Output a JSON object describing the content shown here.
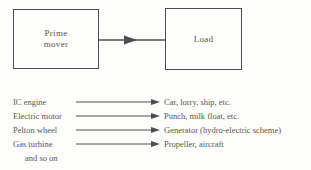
{
  "diagram": {
    "prime_mover": {
      "line1": "Prime",
      "line2": "mover"
    },
    "load": {
      "label": "Load"
    },
    "connector_icon": "arrow-right"
  },
  "mappings": {
    "rows": [
      {
        "source": "IC engine",
        "target": "Car, lorry, ship, etc."
      },
      {
        "source": "Electric motor",
        "target": "Punch, milk float, etc."
      },
      {
        "source": "Pelton wheel",
        "target": "Generator (hydro-electric scheme)"
      },
      {
        "source": "Gas turbine",
        "target": "Propeller, aircraft"
      }
    ],
    "footer": "and so on"
  },
  "colors": {
    "background": "#fdfdfb",
    "ink": "#5b554c",
    "line": "#4e4e4e"
  }
}
